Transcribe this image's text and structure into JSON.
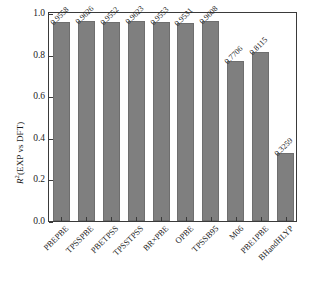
{
  "chart_data": {
    "type": "bar",
    "title": "",
    "subtitle": "",
    "xlabel": "",
    "ylabel": "R2(EXP vs DFT)",
    "ylabel_parts": {
      "symbol": "R",
      "exponent": "2",
      "rest": "(EXP vs DFT)"
    },
    "ylim": [
      0.0,
      1.0
    ],
    "yticks": [
      "0.0",
      "0.2",
      "0.4",
      "0.6",
      "0.8",
      "1.0"
    ],
    "ytick_values": [
      0.0,
      0.2,
      0.4,
      0.6,
      0.8,
      1.0
    ],
    "grid": false,
    "legend": "none",
    "bar_color": "#7f7f7f",
    "frame_color": "#3a3a3a",
    "background": "#ffffff",
    "categories": [
      "PBEPBE",
      "TPSSPBE",
      "PBETPSS",
      "TPSSTPSS",
      "BR×PBE",
      "OPBE",
      "TPSSB95",
      "M06",
      "PBE1PBE",
      "BHandHLYP"
    ],
    "values": [
      0.9558,
      0.9626,
      0.9552,
      0.9623,
      0.9553,
      0.9531,
      0.9608,
      0.7706,
      0.8115,
      0.3259
    ],
    "value_labels": [
      "0.9558",
      "0.9626",
      "0.9552",
      "0.9623",
      "0.9553",
      "0.9531",
      "0.9608",
      "0.7706",
      "0.8115",
      "0.3259"
    ]
  }
}
